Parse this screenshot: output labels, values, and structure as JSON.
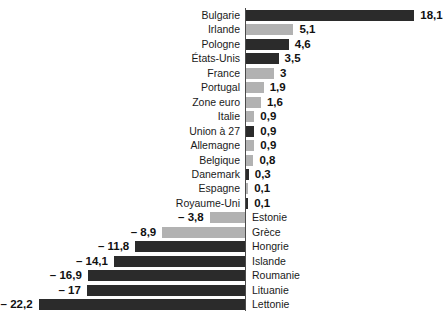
{
  "chart_data": {
    "type": "bar",
    "orientation": "horizontal",
    "title": "",
    "subtitle": "",
    "xlabel": "",
    "ylabel": "",
    "grid": false,
    "legend": null,
    "axis": {
      "zero_line": true,
      "xlim": [
        -22.2,
        18.1
      ]
    },
    "colors": {
      "dark": "#2b2b2b",
      "light": "#b2b2b2",
      "axis": "#4a4a4a",
      "text": "#1a1a1a"
    },
    "decimal_separator": ",",
    "negative_sign_glyph": "–",
    "categories": [
      "Bulgarie",
      "Irlande",
      "Pologne",
      "États-Unis",
      "France",
      "Portugal",
      "Zone euro",
      "Italie",
      "Union à 27",
      "Allemagne",
      "Belgique",
      "Danemark",
      "Espagne",
      "Royaume-Uni",
      "Estonie",
      "Grèce",
      "Hongrie",
      "Islande",
      "Roumanie",
      "Lituanie",
      "Lettonie"
    ],
    "values": [
      18.1,
      5.1,
      4.6,
      3.5,
      3,
      1.9,
      1.6,
      0.9,
      0.9,
      0.9,
      0.8,
      0.3,
      0.1,
      0.1,
      -3.8,
      -8.9,
      -11.8,
      -14.1,
      -16.9,
      -17,
      -22.2
    ],
    "value_labels": [
      "18,1",
      "5,1",
      "4,6",
      "3,5",
      "3",
      "1,9",
      "1,6",
      "0,9",
      "0,9",
      "0,9",
      "0,8",
      "0,3",
      "0,1",
      "0,1",
      "– 3,8",
      "– 8,9",
      "– 11,8",
      "– 14,1",
      "– 16,9",
      "– 17",
      "– 22,2"
    ],
    "bar_shades": [
      "dark",
      "light",
      "dark",
      "dark",
      "light",
      "light",
      "light",
      "light",
      "dark",
      "light",
      "light",
      "dark",
      "light",
      "dark",
      "light",
      "light",
      "dark",
      "dark",
      "dark",
      "dark",
      "dark"
    ]
  },
  "rows": [
    {
      "label": "Bulgarie",
      "value": 18.1,
      "value_label": "18,1",
      "shade": "dark"
    },
    {
      "label": "Irlande",
      "value": 5.1,
      "value_label": "5,1",
      "shade": "light"
    },
    {
      "label": "Pologne",
      "value": 4.6,
      "value_label": "4,6",
      "shade": "dark"
    },
    {
      "label": "États-Unis",
      "value": 3.5,
      "value_label": "3,5",
      "shade": "dark"
    },
    {
      "label": "France",
      "value": 3,
      "value_label": "3",
      "shade": "light"
    },
    {
      "label": "Portugal",
      "value": 1.9,
      "value_label": "1,9",
      "shade": "light"
    },
    {
      "label": "Zone euro",
      "value": 1.6,
      "value_label": "1,6",
      "shade": "light"
    },
    {
      "label": "Italie",
      "value": 0.9,
      "value_label": "0,9",
      "shade": "light"
    },
    {
      "label": "Union à 27",
      "value": 0.9,
      "value_label": "0,9",
      "shade": "dark"
    },
    {
      "label": "Allemagne",
      "value": 0.9,
      "value_label": "0,9",
      "shade": "light"
    },
    {
      "label": "Belgique",
      "value": 0.8,
      "value_label": "0,8",
      "shade": "light"
    },
    {
      "label": "Danemark",
      "value": 0.3,
      "value_label": "0,3",
      "shade": "dark"
    },
    {
      "label": "Espagne",
      "value": 0.1,
      "value_label": "0,1",
      "shade": "light"
    },
    {
      "label": "Royaume-Uni",
      "value": 0.1,
      "value_label": "0,1",
      "shade": "dark"
    },
    {
      "label": "Estonie",
      "value": -3.8,
      "value_label": "– 3,8",
      "shade": "light"
    },
    {
      "label": "Grèce",
      "value": -8.9,
      "value_label": "– 8,9",
      "shade": "light"
    },
    {
      "label": "Hongrie",
      "value": -11.8,
      "value_label": "– 11,8",
      "shade": "dark"
    },
    {
      "label": "Islande",
      "value": -14.1,
      "value_label": "– 14,1",
      "shade": "dark"
    },
    {
      "label": "Roumanie",
      "value": -16.9,
      "value_label": "– 16,9",
      "shade": "dark"
    },
    {
      "label": "Lituanie",
      "value": -17,
      "value_label": "– 17",
      "shade": "dark"
    },
    {
      "label": "Lettonie",
      "value": -22.2,
      "value_label": "– 22,2",
      "shade": "dark"
    }
  ],
  "geometry": {
    "axis_x": 245,
    "top_y": 8,
    "row_pitch": 14.45,
    "bar_height": 11,
    "px_per_unit": 9.3
  }
}
